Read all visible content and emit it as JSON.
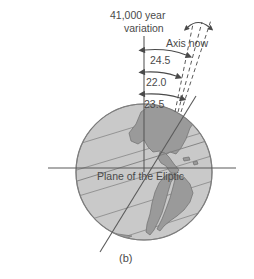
{
  "figure": {
    "caption": "(b)",
    "title_line1": "41,000 year",
    "title_line2": "variation",
    "axis_now_label": "Axis now",
    "plane_label": "Plane of the Eliptic",
    "angles": [
      {
        "value": "24.5"
      },
      {
        "value": "22.0"
      },
      {
        "value": "23.5"
      }
    ],
    "colors": {
      "ocean": "#c9c9c9",
      "land": "#9a9a9a",
      "outline": "#6e6e6e",
      "line": "#5a5a5a",
      "text": "#4a4a4a",
      "background": "#ffffff"
    }
  }
}
